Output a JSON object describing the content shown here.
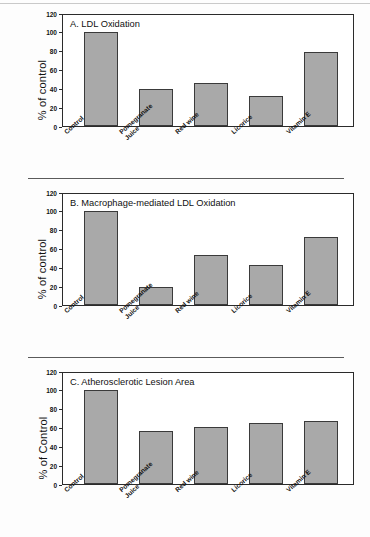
{
  "figure": {
    "categories": [
      "Control",
      "Pomegranate\nJuice",
      "Red wine",
      "Licorice",
      "Vitamin E"
    ],
    "yticks": [
      "0",
      "20",
      "40",
      "60",
      "80",
      "100",
      "120"
    ],
    "bar_color": "#a9a9a9",
    "bar_border_color": "#3a3a3a",
    "axis_color": "#2b2b2b"
  },
  "chart_data": [
    {
      "type": "bar",
      "panel": "A",
      "title": "A. LDL Oxidation",
      "categories": [
        "Control",
        "Pomegranate Juice",
        "Red wine",
        "Licorice",
        "Vitamin E"
      ],
      "values": [
        100,
        39,
        46,
        32,
        79
      ],
      "xlabel": "",
      "ylabel": "% of control",
      "ylim": [
        0,
        120
      ],
      "yticks": [
        0,
        20,
        40,
        60,
        80,
        100,
        120
      ],
      "grid": false,
      "legend": "none"
    },
    {
      "type": "bar",
      "panel": "B",
      "title": "B. Macrophage-mediated LDL Oxidation",
      "categories": [
        "Control",
        "Pomegranate Juice",
        "Red wine",
        "Licorice",
        "Vitamin E"
      ],
      "values": [
        100,
        19,
        53,
        42,
        72
      ],
      "xlabel": "",
      "ylabel": "% of control",
      "ylim": [
        0,
        120
      ],
      "yticks": [
        0,
        20,
        40,
        60,
        80,
        100,
        120
      ],
      "grid": false,
      "legend": "none"
    },
    {
      "type": "bar",
      "panel": "C",
      "title": "C. Atherosclerotic Lesion Area",
      "categories": [
        "Control",
        "Pomegranate Juice",
        "Red wine",
        "Licorice",
        "Vitamin E"
      ],
      "values": [
        100,
        56,
        61,
        65,
        67
      ],
      "xlabel": "",
      "ylabel": "% of Control",
      "ylim": [
        0,
        120
      ],
      "yticks": [
        0,
        20,
        40,
        60,
        80,
        100,
        120
      ],
      "grid": false,
      "legend": "none"
    }
  ]
}
